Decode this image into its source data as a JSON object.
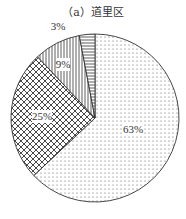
{
  "chart_data": {
    "type": "pie",
    "title": "（a）道里区",
    "start_angle_deg": 0,
    "direction": "clockwise",
    "slices": [
      {
        "label": "63%",
        "value": 63,
        "pattern": "dots"
      },
      {
        "label": "25%",
        "value": 25,
        "pattern": "crosshatch"
      },
      {
        "label": "9%",
        "value": 9,
        "pattern": "vertical-lines"
      },
      {
        "label": "3%",
        "value": 3,
        "pattern": "horizontal-lines"
      }
    ],
    "legend": null
  }
}
